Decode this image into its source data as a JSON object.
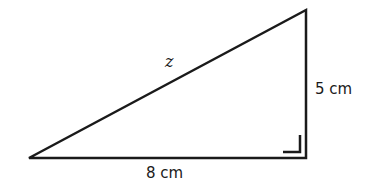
{
  "diagram": {
    "type": "right-triangle",
    "vertices": {
      "left": [
        29,
        158
      ],
      "top_right": [
        306,
        10
      ],
      "bottom_right": [
        306,
        158
      ]
    },
    "labels": {
      "hypotenuse": "z",
      "vertical_side": "5 cm",
      "horizontal_side": "8 cm"
    },
    "right_angle_marker": true,
    "stroke_color": "#1a1a1a",
    "background": "#ffffff"
  }
}
